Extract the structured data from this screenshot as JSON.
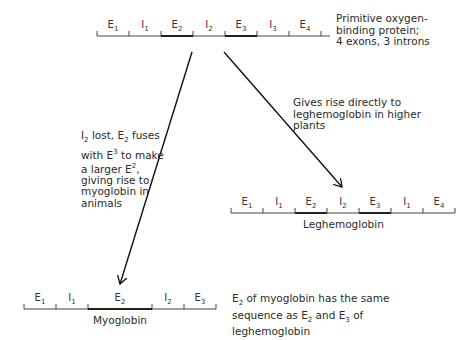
{
  "primitive_gene": {
    "segments": [
      {
        "base": "E",
        "sub": "1",
        "exon": true
      },
      {
        "base": "I",
        "sub": "1",
        "exon": false
      },
      {
        "base": "E",
        "sub": "2",
        "exon": true
      },
      {
        "base": "I",
        "sub": "2",
        "exon": false
      },
      {
        "base": "E",
        "sub": "3",
        "exon": true
      },
      {
        "base": "I",
        "sub": "3",
        "exon": false
      },
      {
        "base": "E",
        "sub": "4",
        "exon": true
      }
    ],
    "caption": "Primitive oxygen-\nbinding protein;\n4 exons, 3 introns"
  },
  "myoglobin_path": {
    "caption_parts": [
      "I",
      "2",
      " lost, E",
      "2",
      " fuses\nwith E",
      "3",
      " to make\na larger E",
      "2",
      ",\ngiving rise to\nmyoglobin in\nanimals"
    ]
  },
  "leghemoglobin_path": {
    "caption": "Gives rise directly to\nleghemoglobin in higher\nplants"
  },
  "leghemoglobin_gene": {
    "name": "Leghemoglobin",
    "segments": [
      {
        "base": "E",
        "sub": "1"
      },
      {
        "base": "I",
        "sub": "1"
      },
      {
        "base": "E",
        "sub": "2"
      },
      {
        "base": "I",
        "sub": "2"
      },
      {
        "base": "E",
        "sub": "3"
      },
      {
        "base": "I",
        "sub": "1"
      },
      {
        "base": "E",
        "sub": "4"
      }
    ]
  },
  "myoglobin_gene": {
    "name": "Myoglobin",
    "segments": [
      {
        "base": "E",
        "sub": "1"
      },
      {
        "base": "I",
        "sub": "1"
      },
      {
        "base": "E",
        "sub": "2"
      },
      {
        "base": "I",
        "sub": "2"
      },
      {
        "base": "E",
        "sub": "3"
      }
    ],
    "caption_parts": [
      "E",
      "2",
      " of myoglobin has the same\nsequence as E",
      "2",
      " and E",
      "3",
      " of\nleghemoglobin"
    ]
  }
}
